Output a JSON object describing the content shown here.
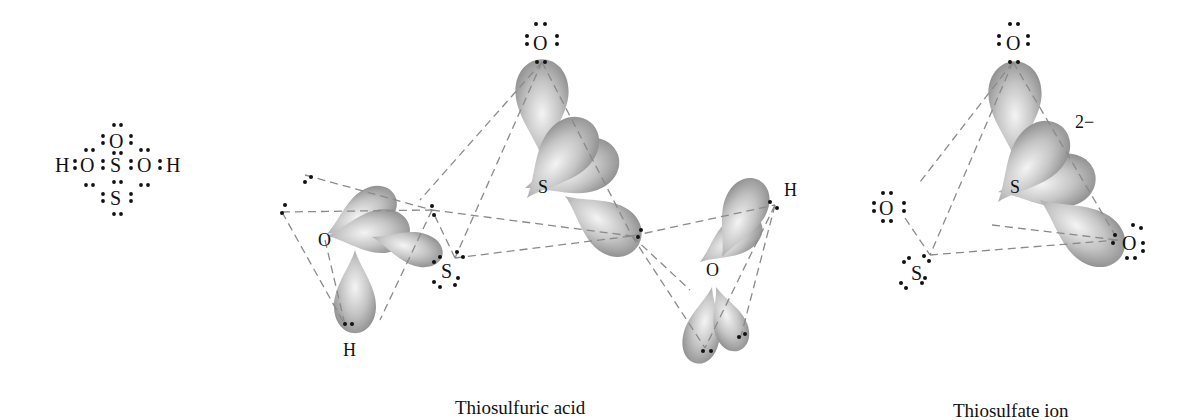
{
  "figure": {
    "panels": [
      {
        "id": "lewis-structure",
        "title": "",
        "atoms": {
          "top_O": "O",
          "left_H": "H",
          "left_O": "O",
          "center_S": "S",
          "right_O": "O",
          "right_H": "H",
          "bottom_S": "S"
        }
      },
      {
        "id": "thiosulfuric-acid",
        "caption": "Thiosulfuric acid",
        "atoms": {
          "top_O": "O",
          "center_S": "S",
          "left_O": "O",
          "left_H": "H",
          "terminal_S": "S",
          "right_O": "O",
          "right_H": "H"
        }
      },
      {
        "id": "thiosulfate-ion",
        "caption": "Thiosulfate ion",
        "charge": "2−",
        "atoms": {
          "top_O": "O",
          "center_S": "S",
          "left_O": "O",
          "terminal_S": "S",
          "right_O": "O"
        }
      }
    ]
  },
  "colors": {
    "lobe_dark": "#8c8c8c",
    "lobe_light": "#f2f2f2",
    "dash": "#8a8a8a",
    "text": "#111111"
  }
}
